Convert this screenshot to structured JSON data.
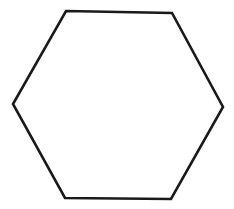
{
  "diagram": {
    "shape": "hexagon",
    "background": "#ffffff",
    "stroke_color": "#1a1a1a",
    "stroke_width": 2.6,
    "fill": "none",
    "vertices": [
      [
        66,
        11
      ],
      [
        172,
        13
      ],
      [
        223,
        107
      ],
      [
        171,
        199
      ],
      [
        65,
        198
      ],
      [
        13,
        104
      ]
    ]
  }
}
